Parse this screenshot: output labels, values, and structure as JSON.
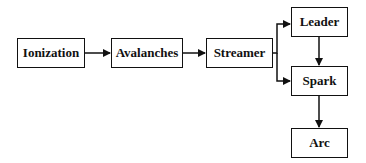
{
  "diagram": {
    "nodes": [
      {
        "id": "ionization",
        "label": "Ionization"
      },
      {
        "id": "avalanches",
        "label": "Avalanches"
      },
      {
        "id": "streamer",
        "label": "Streamer"
      },
      {
        "id": "leader",
        "label": "Leader"
      },
      {
        "id": "spark",
        "label": "Spark"
      },
      {
        "id": "arc",
        "label": "Arc"
      }
    ],
    "edges": [
      {
        "from": "ionization",
        "to": "avalanches"
      },
      {
        "from": "avalanches",
        "to": "streamer"
      },
      {
        "from": "streamer",
        "to": "leader"
      },
      {
        "from": "streamer",
        "to": "spark"
      },
      {
        "from": "leader",
        "to": "spark"
      },
      {
        "from": "spark",
        "to": "arc"
      }
    ],
    "colors": {
      "stroke": "#111111",
      "background": "#ffffff"
    }
  }
}
